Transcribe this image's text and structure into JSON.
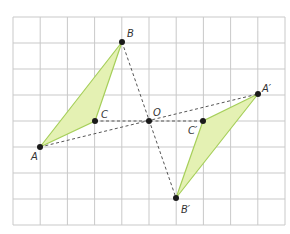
{
  "diagram": {
    "type": "point-reflection-through-origin",
    "grid": {
      "x0": 13,
      "y0": 17,
      "cols": 10,
      "rows": 8,
      "cell_w": 27.2,
      "cell_h": 26,
      "color": "#c9c9c9"
    },
    "colors": {
      "fill": "#e4f1b3",
      "stroke": "#a6cf5a",
      "dash": "#555555",
      "point": "#1a1a1a"
    },
    "points": {
      "A": {
        "label": "A",
        "x": 40,
        "y": 147
      },
      "B": {
        "label": "B",
        "x": 122,
        "y": 42
      },
      "C": {
        "label": "C",
        "x": 95,
        "y": 121
      },
      "O": {
        "label": "O",
        "x": 149,
        "y": 121
      },
      "A2": {
        "label": "A′",
        "x": 258,
        "y": 94
      },
      "B2": {
        "label": "B′",
        "x": 176,
        "y": 198
      },
      "C2": {
        "label": "C′",
        "x": 203,
        "y": 121
      }
    },
    "triangles": [
      {
        "name": "ABC",
        "vertices": [
          "A",
          "B",
          "C"
        ]
      },
      {
        "name": "A′B′C′",
        "vertices": [
          "A2",
          "B2",
          "C2"
        ]
      }
    ],
    "dashed_lines": [
      [
        "A",
        "A2"
      ],
      [
        "B",
        "B2"
      ],
      [
        "C",
        "C2"
      ]
    ]
  }
}
